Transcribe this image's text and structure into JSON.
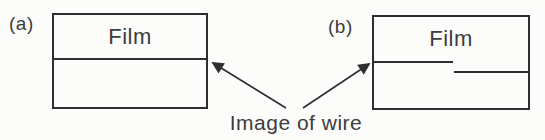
{
  "figure": {
    "panels": [
      {
        "label": "(a)",
        "film_label": "Film"
      },
      {
        "label": "(b)",
        "film_label": "Film"
      }
    ],
    "caption": "Image of wire",
    "icons": [
      "arrowhead-icon",
      "arrowhead-icon"
    ],
    "colors": {
      "ink": "#2e2e2e",
      "text": "#3d3d3d",
      "background": "#fcfcfa"
    }
  }
}
